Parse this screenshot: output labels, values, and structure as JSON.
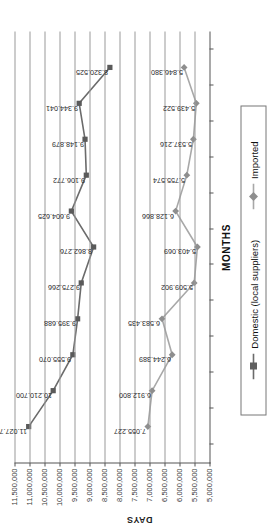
{
  "chart_data": {
    "type": "line",
    "title": "",
    "xlabel": "MONTHS",
    "ylabel": "DAYS",
    "ylim": [
      5000000,
      11500000
    ],
    "ytick_labels": [
      "11,500,000",
      "11,000,000",
      "10,500,000",
      "10,000,000",
      "9,500,000",
      "9,000,000",
      "8,500,000",
      "8,000,000",
      "7,500,000",
      "7,000,000",
      "6,500,000",
      "6,000,000",
      "5,500,000",
      "5,000,000"
    ],
    "ytick_values": [
      11500000,
      11000000,
      10500000,
      10000000,
      9500000,
      9000000,
      8500000,
      8000000,
      7500000,
      7000000,
      6500000,
      6000000,
      5500000,
      5000000
    ],
    "grid": true,
    "legend_position": "bottom",
    "categories": [
      "1",
      "2",
      "3",
      "4",
      "5",
      "6",
      "7",
      "8",
      "9",
      "10",
      "11"
    ],
    "series": [
      {
        "name": "Domestic (local suppliers)",
        "color": "#6b6b6b",
        "marker": "square",
        "values": [
          11027738,
          10210700,
          9555070,
          9395688,
          9275266,
          8862276,
          9604625,
          9106772,
          9148879,
          9344041,
          8320525
        ],
        "labels": [
          "11.027.738",
          "10.210.700",
          "9.555.070",
          "9.395.688",
          "9.275.266",
          "8.862.276",
          "9.604.625",
          "9.106.772",
          "9.148.879",
          "9.344.041",
          "8.320.525"
        ]
      },
      {
        "name": "Imported",
        "color": "#a8a8a8",
        "marker": "diamond",
        "values": [
          7055227,
          6912800,
          6244389,
          6583435,
          5509902,
          5403069,
          6128866,
          5755574,
          5537216,
          5439522,
          5846380
        ],
        "labels": [
          "7.055.227",
          "6.912.800",
          "6.244.389",
          "6.583.435",
          "5.509.902",
          "5.403.069",
          "6.128.866",
          "5.755.574",
          "5.537.216",
          "5.439.522",
          "5.846.380"
        ]
      }
    ]
  },
  "legend": {
    "items": [
      {
        "label": "Domestic (local suppliers)"
      },
      {
        "label": "Imported"
      }
    ]
  },
  "axes": {
    "x_title": "MONTHS",
    "y_title": "DAYS"
  }
}
